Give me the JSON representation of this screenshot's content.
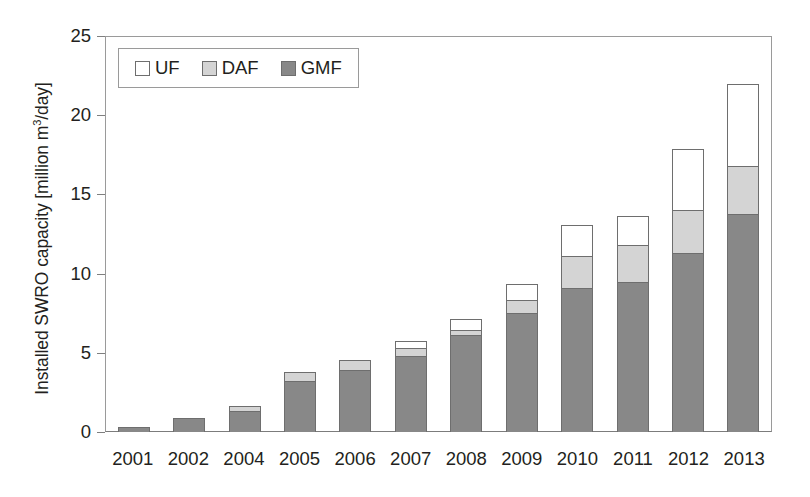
{
  "chart_data": {
    "type": "bar",
    "stacked": true,
    "title": "",
    "subtitle": "",
    "xlabel": "",
    "ylabel": "Installed SWRO capacity [million m3/day]",
    "ylabel_parts": {
      "before": "Installed SWRO capacity [million m",
      "superscript": "3",
      "after": "/day]"
    },
    "categories": [
      "2001",
      "2002",
      "2004",
      "2005",
      "2006",
      "2007",
      "2008",
      "2009",
      "2010",
      "2011",
      "2012",
      "2013"
    ],
    "series": [
      {
        "name": "GMF",
        "color": "#888888",
        "values": [
          0.3,
          0.9,
          1.35,
          3.2,
          3.9,
          4.8,
          6.1,
          7.5,
          9.1,
          9.5,
          11.3,
          13.8
        ]
      },
      {
        "name": "DAF",
        "color": "#d4d4d4",
        "values": [
          0.0,
          0.0,
          0.35,
          0.65,
          0.7,
          0.6,
          0.4,
          0.9,
          2.1,
          2.4,
          2.8,
          3.1
        ]
      },
      {
        "name": "UF",
        "color": "#ffffff",
        "values": [
          0.0,
          0.0,
          0.0,
          0.05,
          0.05,
          0.5,
          0.8,
          1.1,
          2.0,
          1.9,
          3.9,
          5.2
        ]
      }
    ],
    "totals": [
      0.3,
      0.9,
      1.7,
      3.9,
      4.65,
      5.9,
      7.3,
      9.5,
      13.2,
      13.8,
      18.0,
      22.1
    ],
    "ylim": [
      0,
      25
    ],
    "yticks": [
      0,
      5,
      10,
      15,
      20,
      25
    ],
    "ytick_labels": [
      "0",
      "5",
      "10",
      "15",
      "20",
      "25"
    ],
    "grid": false,
    "legend": {
      "position": "top-left-inside",
      "entries": [
        {
          "label": "UF",
          "color": "#ffffff"
        },
        {
          "label": "DAF",
          "color": "#d4d4d4"
        },
        {
          "label": "GMF",
          "color": "#888888"
        }
      ]
    }
  }
}
